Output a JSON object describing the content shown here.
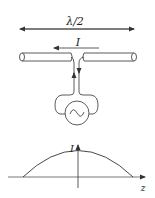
{
  "diagram": {
    "length_label": "λ/2",
    "current_label": "I",
    "source": "ac-source",
    "plot": {
      "y_label": "I",
      "x_label": "z"
    }
  },
  "colors": {
    "stroke": "#333333",
    "background": "#ffffff"
  }
}
